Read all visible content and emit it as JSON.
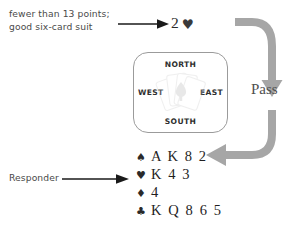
{
  "diagram": {
    "background_color": "#ffffff"
  },
  "opener": {
    "note_line_1": "fewer than 13 points;",
    "note_line_2": "good six-card suit",
    "arrow_icon": "right-arrow-icon",
    "arrow_color": "#1a1a1a",
    "bid": {
      "level": "2",
      "suit_symbol": "♥",
      "suit_name": "hearts",
      "color": "#2b2b2b"
    }
  },
  "table": {
    "north_label": "NORTH",
    "south_label": "SOUTH",
    "west_label": "WEST",
    "east_label": "EAST",
    "center_graphic": "playing-cards-fan-icon",
    "border_color": "#9b9b9b"
  },
  "pass_flow": {
    "label": "Pass",
    "arrow_icon": "curved-flow-arrow-icon",
    "arrow_color": "#a6a6a6",
    "label_color": "#4f4f4f"
  },
  "responder": {
    "label": "Responder",
    "arrow_icon": "right-arrow-icon",
    "arrow_color": "#1a1a1a",
    "hand": [
      {
        "suit_symbol": "♠",
        "suit_name": "spades",
        "cards": "A K 8 2"
      },
      {
        "suit_symbol": "♥",
        "suit_name": "hearts",
        "cards": "K 4 3"
      },
      {
        "suit_symbol": "♦",
        "suit_name": "diamonds",
        "cards": "4"
      },
      {
        "suit_symbol": "♣",
        "suit_name": "clubs",
        "cards": "K Q 8 6 5"
      }
    ]
  }
}
